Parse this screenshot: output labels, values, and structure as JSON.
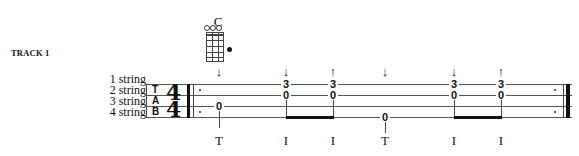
{
  "track": {
    "label": "TRACK 1"
  },
  "string_labels": [
    "1 string",
    "2 string",
    "3 string",
    "4 string"
  ],
  "tab_clef": [
    "T",
    "A",
    "B"
  ],
  "time_signature": {
    "top": "4",
    "bottom": "4"
  },
  "chord": {
    "name": "C",
    "open_strings": [
      "o",
      "o",
      "o"
    ],
    "fretted": {
      "string": 4,
      "fret": 3
    }
  },
  "notes": [
    {
      "x": 219,
      "frets": {
        "3": "0"
      },
      "stroke": "",
      "finger": "T"
    },
    {
      "x": 286,
      "frets": {
        "1": "3",
        "2": "0"
      },
      "stroke": "down",
      "finger": "I"
    },
    {
      "x": 333,
      "frets": {
        "1": "3",
        "2": "0"
      },
      "stroke": "up",
      "finger": "I"
    },
    {
      "x": 385,
      "frets": {
        "4": "0"
      },
      "stroke": "down",
      "finger": "T"
    },
    {
      "x": 454,
      "frets": {
        "1": "3",
        "2": "0"
      },
      "stroke": "down",
      "finger": "I"
    },
    {
      "x": 501,
      "frets": {
        "1": "3",
        "2": "0"
      },
      "stroke": "up",
      "finger": "I"
    }
  ],
  "labels": {
    "n0_fret3": "0",
    "n1_fret1": "3",
    "n1_fret2": "0",
    "n2_fret1": "3",
    "n2_fret2": "0",
    "n3_fret4": "0",
    "n4_fret1": "3",
    "n4_fret2": "0",
    "n5_fret1": "3",
    "n5_fret2": "0",
    "down_arrow": "↓",
    "up_arrow": "↑",
    "f0": "T",
    "f1": "I",
    "f2": "I",
    "f3": "T",
    "f4": "I",
    "f5": "I"
  }
}
